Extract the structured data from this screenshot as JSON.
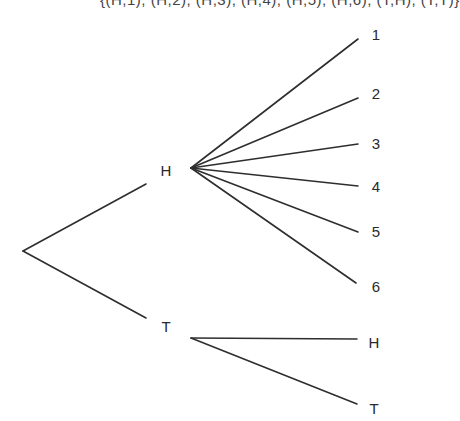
{
  "top_text": "{(H,1), (H,2), (H,3), (H,4), (H,5), (H,6), (T,H), (T,T)}",
  "colors": {
    "line": "#2e2e2e",
    "text": "#2a2a2a",
    "background": "#ffffff"
  },
  "tree": {
    "root": {
      "x": 23,
      "y": 251
    },
    "level1": [
      {
        "label": "H",
        "label_pos": {
          "x": 166,
          "y": 170
        },
        "edge_end": {
          "x": 146,
          "y": 184
        },
        "branch_origin": {
          "x": 191,
          "y": 168
        }
      },
      {
        "label": "T",
        "label_pos": {
          "x": 166,
          "y": 326
        },
        "edge_end": {
          "x": 146,
          "y": 318
        },
        "branch_origin": {
          "x": 191,
          "y": 338
        }
      }
    ],
    "level2_H": [
      {
        "label": "1",
        "label_pos": {
          "x": 376,
          "y": 34
        },
        "edge_end": {
          "x": 358,
          "y": 39
        }
      },
      {
        "label": "2",
        "label_pos": {
          "x": 376,
          "y": 93
        },
        "edge_end": {
          "x": 358,
          "y": 98
        }
      },
      {
        "label": "3",
        "label_pos": {
          "x": 376,
          "y": 143
        },
        "edge_end": {
          "x": 358,
          "y": 144
        }
      },
      {
        "label": "4",
        "label_pos": {
          "x": 376,
          "y": 186
        },
        "edge_end": {
          "x": 358,
          "y": 186
        }
      },
      {
        "label": "5",
        "label_pos": {
          "x": 376,
          "y": 231
        },
        "edge_end": {
          "x": 358,
          "y": 232
        }
      },
      {
        "label": "6",
        "label_pos": {
          "x": 376,
          "y": 286
        },
        "edge_end": {
          "x": 356,
          "y": 283
        }
      }
    ],
    "level2_T": [
      {
        "label": "H",
        "label_pos": {
          "x": 374,
          "y": 342
        },
        "edge_end": {
          "x": 357,
          "y": 339
        }
      },
      {
        "label": "T",
        "label_pos": {
          "x": 374,
          "y": 408
        },
        "edge_end": {
          "x": 357,
          "y": 404
        }
      }
    ]
  }
}
